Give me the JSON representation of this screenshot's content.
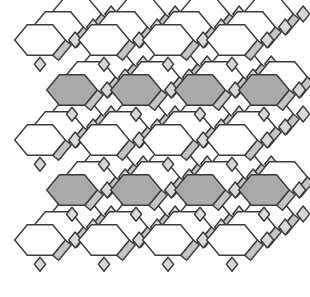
{
  "figure": {
    "colors": {
      "background": "#ffffff",
      "edge": "#3a3a3a",
      "hex_face_light": "#ffffff",
      "hex_face_dark": "#a9a9a9",
      "square_face": "#d9d9d9",
      "side_face": "#c4c4c4"
    },
    "grid": {
      "rows": 5,
      "cols": 4,
      "origin_x": 40,
      "origin_y": 40,
      "col_spacing": 64,
      "row_spacing": 50,
      "hex_radius": 22
    }
  }
}
